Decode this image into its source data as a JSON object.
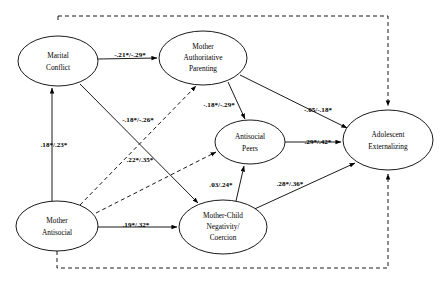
{
  "figure": {
    "type": "path-diagram",
    "title": "",
    "background_color": "#ffffff",
    "line_color": "#000000",
    "width": 443,
    "height": 282
  },
  "nodes": [
    {
      "id": "marital_conflict",
      "label_lines": [
        "Marital",
        "Conflict"
      ],
      "line1": "Marital",
      "line2": "Conflict",
      "line3": "",
      "cx": 58,
      "cy": 61,
      "rx": 40,
      "ry": 25
    },
    {
      "id": "mother_authoritative_parenting",
      "label_lines": [
        "Mother",
        "Authoritative",
        "Parenting"
      ],
      "line1": "Mother",
      "line2": "Authoritative",
      "line3": "Parenting",
      "cx": 203,
      "cy": 58,
      "rx": 44,
      "ry": 27
    },
    {
      "id": "antisocial_peers",
      "label_lines": [
        "Antisocial",
        "Peers"
      ],
      "line1": "Antisocial",
      "line2": "Peers",
      "line3": "",
      "cx": 250,
      "cy": 142,
      "rx": 35,
      "ry": 22
    },
    {
      "id": "adolescent_externalizing",
      "label_lines": [
        "Adolescent",
        "Externalizing"
      ],
      "line1": "Adolescent",
      "line2": "Externalizing",
      "line3": "",
      "cx": 388,
      "cy": 140,
      "rx": 45,
      "ry": 30
    },
    {
      "id": "mother_antisocial",
      "label_lines": [
        "Mother",
        "Antisocial"
      ],
      "line1": "Mother",
      "line2": "Antisocial",
      "line3": "",
      "cx": 57,
      "cy": 226,
      "rx": 41,
      "ry": 25
    },
    {
      "id": "mother_child_negativity_coercion",
      "label_lines": [
        "Mother-Child",
        "Negativity/",
        "Coercion"
      ],
      "line1": "Mother-Child",
      "line2": "Negativity/",
      "line3": "Coercion",
      "cx": 223,
      "cy": 227,
      "rx": 44,
      "ry": 27
    }
  ],
  "paths": [
    {
      "id": "mc-to-map",
      "from": "marital_conflict",
      "to": "mother_authoritative_parenting",
      "label": "-.21*/-.29*",
      "style": "solid",
      "label_x": 130,
      "label_y": 55
    },
    {
      "id": "map-to-ap",
      "from": "mother_authoritative_parenting",
      "to": "antisocial_peers",
      "label": "-.18*/-.29*",
      "style": "solid",
      "label_x": 219,
      "label_y": 105
    },
    {
      "id": "map-to-ae",
      "from": "mother_authoritative_parenting",
      "to": "adolescent_externalizing",
      "label": "-.05/-.18*",
      "style": "solid",
      "label_x": 318,
      "label_y": 110
    },
    {
      "id": "ma-to-mc",
      "from": "mother_antisocial",
      "to": "marital_conflict",
      "label": ".18*/.23*",
      "style": "solid",
      "label_x": 54,
      "label_y": 145
    },
    {
      "id": "mc-to-mcnc",
      "from": "marital_conflict",
      "to": "mother_child_negativity_coercion",
      "label": ".22*/.35*",
      "style": "solid",
      "label_x": 140,
      "label_y": 160
    },
    {
      "id": "ma-to-map",
      "from": "mother_antisocial",
      "to": "mother_authoritative_parenting",
      "label": "-.18*/-.26*",
      "style": "dashed",
      "label_x": 138,
      "label_y": 120
    },
    {
      "id": "ma-to-mcnc",
      "from": "mother_antisocial",
      "to": "mother_child_negativity_coercion",
      "label": ".19*/.32*",
      "style": "solid",
      "label_x": 136,
      "label_y": 225
    },
    {
      "id": "mcnc-to-ap",
      "from": "mother_child_negativity_coercion",
      "to": "antisocial_peers",
      "label": ".03/.24*",
      "style": "solid",
      "label_x": 221,
      "label_y": 185
    },
    {
      "id": "ap-to-ae",
      "from": "antisocial_peers",
      "to": "adolescent_externalizing",
      "label": ".29*/.42*",
      "style": "solid",
      "label_x": 318,
      "label_y": 142
    },
    {
      "id": "mcnc-to-ae",
      "from": "mother_child_negativity_coercion",
      "to": "adolescent_externalizing",
      "label": ".28*/.36*",
      "style": "solid",
      "label_x": 290,
      "label_y": 184
    },
    {
      "id": "mc-to-ae-dashed",
      "from": "marital_conflict",
      "to": "adolescent_externalizing",
      "label": "",
      "style": "dashed",
      "label_x": 0,
      "label_y": 0
    },
    {
      "id": "ma-to-ae-dashed",
      "from": "mother_antisocial",
      "to": "adolescent_externalizing",
      "label": "",
      "style": "dashed",
      "label_x": 0,
      "label_y": 0
    },
    {
      "id": "ma-to-ap-dashed",
      "from": "mother_antisocial",
      "to": "antisocial_peers",
      "label": "",
      "style": "dashed",
      "label_x": 0,
      "label_y": 0
    }
  ]
}
